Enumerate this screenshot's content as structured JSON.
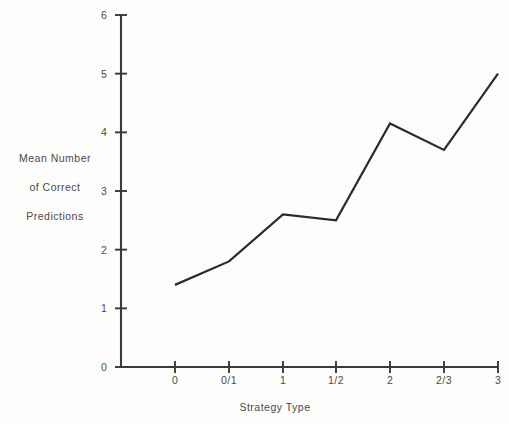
{
  "chart_data": {
    "type": "line",
    "title": "",
    "xlabel": "Strategy Type",
    "ylabel": "Mean Number of Correct Predictions",
    "ylabel_lines": [
      "Mean Number",
      "of Correct",
      "Predictions"
    ],
    "categories": [
      "0",
      "0/1",
      "1",
      "1/2",
      "2",
      "2/3",
      "3"
    ],
    "values": [
      1.4,
      1.8,
      2.6,
      2.5,
      4.15,
      3.7,
      5.0
    ],
    "series": [
      {
        "name": "Mean Number of Correct Predictions",
        "values": [
          1.4,
          1.8,
          2.6,
          2.5,
          4.15,
          3.7,
          5.0
        ]
      }
    ],
    "ylim": [
      0,
      6
    ],
    "yticks": [
      0,
      1,
      2,
      3,
      4,
      5,
      6
    ],
    "ytick_labels": [
      "0",
      "1",
      "2",
      "3",
      "4",
      "5",
      "6"
    ],
    "grid": false,
    "legend": false,
    "legend_position": "none",
    "line_color": "#2b2b2b",
    "axis_color": "#3a3a3a",
    "background_color": "#fdfdfb"
  },
  "figure": {
    "plot_left_px": 121,
    "plot_baseline_px": 367,
    "plot_top_px": 15,
    "plot_right_px": 498,
    "category_x_px": [
      175,
      229,
      283,
      336,
      390,
      444,
      498
    ],
    "ylabel_block_center_x_px": 55,
    "ylabel_line_y_px": [
      162,
      191,
      220
    ],
    "xlabel_center_x_px": 275,
    "xlabel_y_px": 411,
    "ytick_label_x_px": 104,
    "xtick_label_y_px": 384
  }
}
